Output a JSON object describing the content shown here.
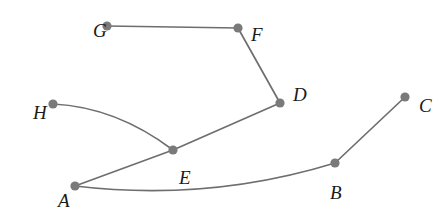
{
  "figure": {
    "kind": "undirected-graph-diagram",
    "background_color": "#ffffff",
    "canvas": {
      "width": 448,
      "height": 217
    },
    "style": {
      "edge_color": "#6e6e6e",
      "edge_width": 1.7,
      "vertex_color": "#7a7a7a",
      "vertex_radius": 4.6,
      "label_color": "#1a1a1a",
      "label_font_size": 19
    },
    "vertices": [
      {
        "id": "A",
        "label": "A",
        "x": 75,
        "y": 186,
        "label_x": 58,
        "label_y": 191
      },
      {
        "id": "B",
        "label": "B",
        "x": 335,
        "y": 163,
        "label_x": 330,
        "label_y": 183
      },
      {
        "id": "C",
        "label": "C",
        "x": 405,
        "y": 97,
        "label_x": 419,
        "label_y": 96
      },
      {
        "id": "D",
        "label": "D",
        "x": 280,
        "y": 103,
        "label_x": 293,
        "label_y": 85
      },
      {
        "id": "E",
        "label": "E",
        "x": 173,
        "y": 150,
        "label_x": 179,
        "label_y": 168
      },
      {
        "id": "F",
        "label": "F",
        "x": 238,
        "y": 28,
        "label_x": 251,
        "label_y": 25
      },
      {
        "id": "G",
        "label": "G",
        "x": 107,
        "y": 26,
        "label_x": 93,
        "label_y": 21
      },
      {
        "id": "H",
        "label": "H",
        "x": 53,
        "y": 104,
        "label_x": 33,
        "label_y": 103
      }
    ],
    "edges": [
      {
        "id": "edge-G-F",
        "from": "G",
        "to": "F",
        "shape": "straight",
        "path": "M 107 26 L 238 28"
      },
      {
        "id": "edge-F-D",
        "from": "F",
        "to": "D",
        "shape": "straight",
        "path": "M 238 28 L 280 103"
      },
      {
        "id": "edge-D-E",
        "from": "D",
        "to": "E",
        "shape": "straight",
        "path": "M 280 103 L 173 150"
      },
      {
        "id": "edge-E-A",
        "from": "E",
        "to": "A",
        "shape": "straight",
        "path": "M 173 150 L 75 186"
      },
      {
        "id": "edge-H-E",
        "from": "H",
        "to": "E",
        "shape": "curved",
        "path": "M 53 104 Q 116 107 173 150"
      },
      {
        "id": "edge-A-B",
        "from": "A",
        "to": "B",
        "shape": "curved",
        "path": "M 75 186 Q 208 202 335 163"
      },
      {
        "id": "edge-B-C",
        "from": "B",
        "to": "C",
        "shape": "straight",
        "path": "M 335 163 L 405 97"
      }
    ]
  }
}
